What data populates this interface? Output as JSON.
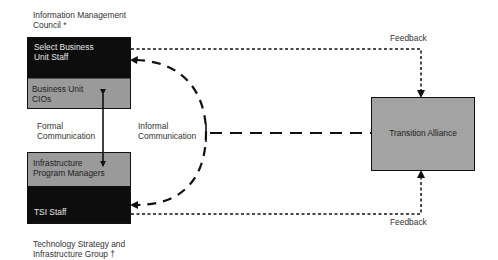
{
  "groups": {
    "top": {
      "caption_line1": "Information Management",
      "caption_line2": "Council *",
      "upper_line1": "Select Business",
      "upper_line2": "Unit Staff",
      "lower_line1": "Business Unit",
      "lower_line2": "CIOs"
    },
    "bottom": {
      "upper_line1": "Infrastructure",
      "upper_line2": "Program Managers",
      "lower_line1": "TSI Staff",
      "caption_line1": "Technology Strategy and",
      "caption_line2": "Infrastructure Group †"
    },
    "right": {
      "title": "Transition Alliance"
    }
  },
  "connectors": {
    "formal_line1": "Formal",
    "formal_line2": "Communication",
    "informal_line1": "Informal",
    "informal_line2": "Communication",
    "feedback_top": "Feedback",
    "feedback_bottom": "Feedback"
  },
  "colors": {
    "dark_fill": "#0d0d0d",
    "gray_fill": "#9a9a9a",
    "line": "#111111"
  }
}
